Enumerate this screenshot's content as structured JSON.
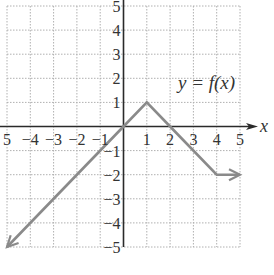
{
  "chart_data": {
    "type": "line",
    "title": "",
    "annotation": "y = f(x)",
    "xlabel": "x",
    "ylabel": "",
    "xlim": [
      -5,
      5
    ],
    "ylim": [
      -5,
      5
    ],
    "grid": true,
    "x_ticks": [
      -5,
      -4,
      -3,
      -2,
      -1,
      1,
      2,
      3,
      4,
      5
    ],
    "y_ticks": [
      -5,
      -4,
      -3,
      -2,
      -1,
      1,
      2,
      3,
      4,
      5
    ],
    "x_tick_labels": [
      "5",
      "−4",
      "−3",
      "−2",
      "−1",
      "1",
      "2",
      "3",
      "4",
      "5"
    ],
    "y_tick_labels": [
      "−5",
      "−4",
      "−3",
      "−2",
      "−1",
      "1",
      "2",
      "3",
      "4",
      "5"
    ],
    "series": [
      {
        "name": "f(x)",
        "points": [
          [
            -5,
            -5
          ],
          [
            0,
            0
          ],
          [
            1,
            1
          ],
          [
            2,
            0
          ],
          [
            4,
            -2
          ],
          [
            5,
            -2
          ]
        ],
        "x": [
          -5,
          0,
          1,
          2,
          4,
          5
        ],
        "y": [
          -5,
          0,
          1,
          0,
          -2,
          -2
        ],
        "arrow_start": true,
        "arrow_end": true,
        "color": "#8a8a8a"
      }
    ],
    "colors": {
      "axes": "#2a2a2a",
      "grid": "#b0b0b0",
      "curve": "#8a8a8a"
    }
  }
}
